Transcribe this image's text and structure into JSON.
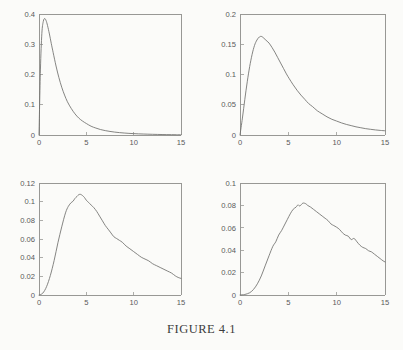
{
  "caption": "FIGURE 4.1",
  "figure": {
    "background_color": "#fbfbf9",
    "axis_color": "#8d8d8a",
    "curve_color": "#6f6f6d",
    "label_color": "#59595a"
  },
  "chart_data": [
    {
      "type": "line",
      "panel": "top-left",
      "title": "",
      "xlabel": "",
      "ylabel": "",
      "xlim": [
        0,
        15
      ],
      "ylim": [
        0,
        0.4
      ],
      "xticks": [
        0,
        5,
        10,
        15
      ],
      "xticklabels": [
        "0",
        "5",
        "10",
        "15"
      ],
      "yticks": [
        0,
        0.1,
        0.2,
        0.3,
        0.4
      ],
      "yticklabels": [
        "0",
        "0.1",
        "0.2",
        "0.3",
        "0.4"
      ],
      "grid": false,
      "legend": "none",
      "peak": {
        "x": 0.6,
        "y": 0.385
      },
      "x": [
        0.0,
        0.15,
        0.3,
        0.45,
        0.6,
        0.75,
        0.9,
        1.1,
        1.3,
        1.5,
        1.8,
        2.1,
        2.4,
        2.7,
        3.0,
        3.4,
        3.8,
        4.2,
        4.6,
        5.0,
        5.5,
        6.0,
        6.5,
        7.0,
        7.5,
        8.0,
        8.5,
        9.0,
        9.5,
        10.0,
        10.5,
        11.0,
        11.5,
        12.0,
        12.5,
        13.0,
        13.5,
        14.0,
        14.5,
        15.0
      ],
      "y": [
        0.0,
        0.215,
        0.335,
        0.375,
        0.385,
        0.378,
        0.362,
        0.334,
        0.302,
        0.272,
        0.228,
        0.19,
        0.158,
        0.132,
        0.11,
        0.088,
        0.07,
        0.056,
        0.046,
        0.038,
        0.029,
        0.023,
        0.018,
        0.0145,
        0.0118,
        0.0096,
        0.0079,
        0.0065,
        0.0054,
        0.0045,
        0.0038,
        0.0032,
        0.0027,
        0.0023,
        0.0019,
        0.0016,
        0.0013,
        0.0011,
        0.0009,
        0.0007
      ]
    },
    {
      "type": "line",
      "panel": "top-right",
      "title": "",
      "xlabel": "",
      "ylabel": "",
      "xlim": [
        0,
        15
      ],
      "ylim": [
        0,
        0.2
      ],
      "xticks": [
        0,
        5,
        10,
        15
      ],
      "xticklabels": [
        "0",
        "5",
        "10",
        "15"
      ],
      "yticks": [
        0,
        0.05,
        0.1,
        0.15,
        0.2
      ],
      "yticklabels": [
        "0",
        "0.05",
        "0.1",
        "0.15",
        "0.2"
      ],
      "grid": false,
      "legend": "none",
      "peak": {
        "x": 2.2,
        "y": 0.163
      },
      "x": [
        0.0,
        0.25,
        0.5,
        0.75,
        1.0,
        1.25,
        1.5,
        1.75,
        2.0,
        2.2,
        2.4,
        2.6,
        2.8,
        3.0,
        3.3,
        3.6,
        3.9,
        4.2,
        4.5,
        4.8,
        5.1,
        5.5,
        5.9,
        6.3,
        6.7,
        7.1,
        7.5,
        8.0,
        8.5,
        9.0,
        9.5,
        10.0,
        10.5,
        11.0,
        11.5,
        12.0,
        12.5,
        13.0,
        13.5,
        14.0,
        14.5,
        15.0
      ],
      "y": [
        0.0,
        0.028,
        0.059,
        0.088,
        0.113,
        0.133,
        0.148,
        0.157,
        0.162,
        0.163,
        0.161,
        0.158,
        0.155,
        0.152,
        0.145,
        0.137,
        0.128,
        0.119,
        0.11,
        0.101,
        0.093,
        0.083,
        0.074,
        0.066,
        0.059,
        0.052,
        0.047,
        0.04,
        0.035,
        0.03,
        0.026,
        0.023,
        0.02,
        0.0175,
        0.0155,
        0.0135,
        0.012,
        0.0105,
        0.0094,
        0.0084,
        0.0076,
        0.007
      ]
    },
    {
      "type": "line",
      "panel": "bottom-left",
      "title": "",
      "xlabel": "",
      "ylabel": "",
      "xlim": [
        0,
        15
      ],
      "ylim": [
        0,
        0.12
      ],
      "xticks": [
        0,
        5,
        10,
        15
      ],
      "xticklabels": [
        "0",
        "5",
        "10",
        "15"
      ],
      "yticks": [
        0,
        0.02,
        0.04,
        0.06,
        0.08,
        0.1,
        0.12
      ],
      "yticklabels": [
        "0",
        "0.02",
        "0.04",
        "0.06",
        "0.08",
        "0.1",
        "0.12"
      ],
      "grid": false,
      "legend": "none",
      "peak": {
        "x": 4.3,
        "y": 0.108
      },
      "x": [
        0.0,
        0.4,
        0.8,
        1.2,
        1.6,
        2.0,
        2.4,
        2.8,
        3.1,
        3.4,
        3.6,
        3.8,
        4.0,
        4.2,
        4.4,
        4.6,
        4.8,
        5.0,
        5.2,
        5.5,
        5.8,
        6.1,
        6.4,
        6.7,
        7.0,
        7.3,
        7.6,
        7.9,
        8.2,
        8.5,
        8.8,
        9.2,
        9.6,
        10.0,
        10.4,
        10.8,
        11.2,
        11.6,
        12.0,
        12.4,
        12.8,
        13.2,
        13.6,
        14.0,
        14.4,
        14.7,
        15.0
      ],
      "y": [
        0.0,
        0.002,
        0.009,
        0.021,
        0.037,
        0.056,
        0.073,
        0.088,
        0.095,
        0.099,
        0.1005,
        0.1035,
        0.1055,
        0.1075,
        0.1078,
        0.1065,
        0.1045,
        0.1015,
        0.0995,
        0.0965,
        0.0935,
        0.0895,
        0.0845,
        0.0795,
        0.0745,
        0.0705,
        0.0665,
        0.0625,
        0.0605,
        0.0585,
        0.0565,
        0.0525,
        0.0495,
        0.0465,
        0.0435,
        0.0405,
        0.0385,
        0.0365,
        0.0335,
        0.0315,
        0.0295,
        0.0275,
        0.0255,
        0.0235,
        0.0205,
        0.0188,
        0.0178
      ]
    },
    {
      "type": "line",
      "panel": "bottom-right",
      "title": "",
      "xlabel": "",
      "ylabel": "",
      "xlim": [
        0,
        15
      ],
      "ylim": [
        0,
        0.1
      ],
      "xticks": [
        0,
        5,
        10,
        15
      ],
      "xticklabels": [
        "0",
        "5",
        "10",
        "15"
      ],
      "yticks": [
        0,
        0.02,
        0.04,
        0.06,
        0.08,
        0.1
      ],
      "yticklabels": [
        "0",
        "0.02",
        "0.04",
        "0.06",
        "0.08",
        "0.1"
      ],
      "grid": false,
      "legend": "none",
      "peak": {
        "x": 6.5,
        "y": 0.082
      },
      "x": [
        0.0,
        0.5,
        1.0,
        1.4,
        1.8,
        2.2,
        2.6,
        3.0,
        3.4,
        3.7,
        4.0,
        4.3,
        4.6,
        4.9,
        5.2,
        5.5,
        5.8,
        6.0,
        6.2,
        6.5,
        6.8,
        7.0,
        7.3,
        7.6,
        7.9,
        8.2,
        8.5,
        8.8,
        9.1,
        9.4,
        9.7,
        10.0,
        10.3,
        10.6,
        10.9,
        11.2,
        11.5,
        11.8,
        12.1,
        12.4,
        12.7,
        13.0,
        13.3,
        13.6,
        13.9,
        14.2,
        14.5,
        14.8,
        15.0
      ],
      "y": [
        0.0,
        0.0005,
        0.002,
        0.005,
        0.01,
        0.017,
        0.026,
        0.035,
        0.0435,
        0.0475,
        0.0535,
        0.0575,
        0.0625,
        0.0675,
        0.0725,
        0.0765,
        0.0785,
        0.0805,
        0.0795,
        0.082,
        0.0815,
        0.08,
        0.0785,
        0.0765,
        0.0745,
        0.0725,
        0.0705,
        0.0685,
        0.0665,
        0.0635,
        0.062,
        0.0605,
        0.0585,
        0.0555,
        0.0535,
        0.0525,
        0.0495,
        0.0505,
        0.0475,
        0.0445,
        0.0425,
        0.0415,
        0.0395,
        0.0385,
        0.0365,
        0.0345,
        0.0325,
        0.0305,
        0.0295
      ]
    }
  ]
}
